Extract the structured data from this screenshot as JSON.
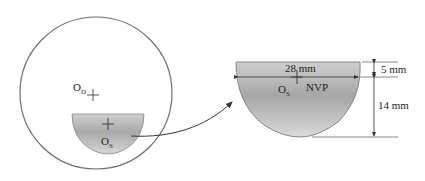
{
  "diagram": {
    "eye": {
      "center_label": "O",
      "center_sub": "D",
      "shape": "circle"
    },
    "insert_small": {
      "label": "O",
      "label_sub": "S",
      "shape": "truncated-disc"
    },
    "insert_detail": {
      "center_label": "O",
      "center_sub": "S",
      "region_label": "NVP",
      "width_label": "28 mm",
      "top_height_label": "5 mm",
      "bottom_height_label": "14 mm"
    },
    "colors": {
      "outline": "#6e6e6e",
      "fill_light": "#d4d4d4",
      "fill_dark": "#a8a8a8",
      "text": "#222222"
    }
  }
}
